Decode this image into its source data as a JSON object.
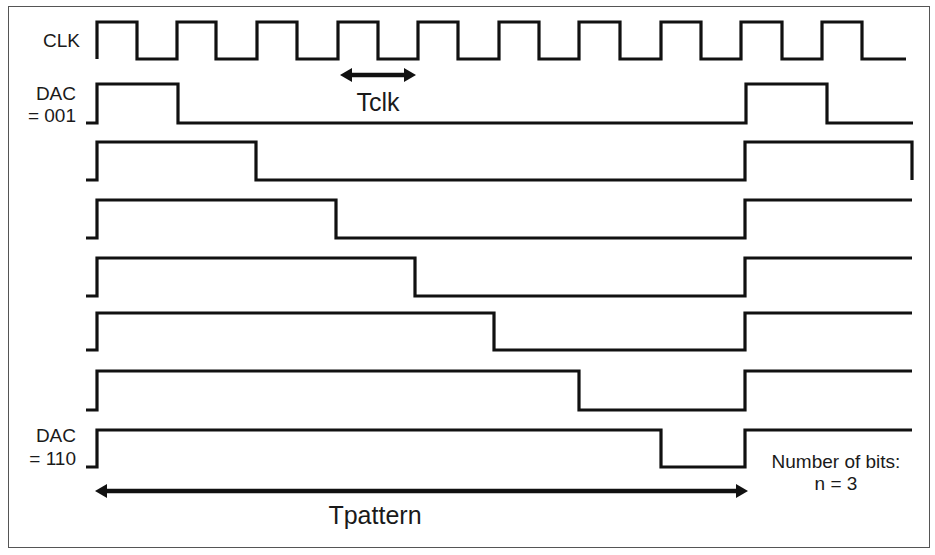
{
  "figure": {
    "labels": {
      "clk": "CLK",
      "dac_first_line1": "DAC",
      "dac_first_line2": "= 001",
      "dac_last_line1": "DAC",
      "dac_last_line2": "= 110",
      "tclk": "Tclk",
      "tpattern": "Tpattern",
      "bits_line1": "Number of bits:",
      "bits_line2": "n = 3"
    },
    "colors": {
      "line": "#111111",
      "frame": "#555555",
      "background": "#ffffff"
    },
    "clock": {
      "name": "CLK",
      "y_high": 22,
      "y_low": 59,
      "x_start": 97,
      "x_end": 906,
      "edges": [
        97,
        137,
        177,
        216,
        257,
        297,
        338,
        378,
        418,
        458,
        499,
        539,
        579,
        620,
        661,
        701,
        741,
        782,
        822,
        862
      ]
    },
    "dac_rows": [
      {
        "code": "001",
        "y_high": 84,
        "y_low": 123,
        "lead_x": 86,
        "rise_x": 97,
        "fall_x": 178,
        "rise2_x": 746,
        "fall2_x": 827,
        "end_x": 913
      },
      {
        "code": "010",
        "y_high": 142,
        "y_low": 180,
        "lead_x": 86,
        "rise_x": 97,
        "fall_x": 256,
        "rise2_x": 745,
        "fall2_x": 912,
        "end_x": 912
      },
      {
        "code": "011",
        "y_high": 200,
        "y_low": 238,
        "lead_x": 86,
        "rise_x": 97,
        "fall_x": 336,
        "rise2_x": 745,
        "fall2_x": null,
        "end_x": 912
      },
      {
        "code": "100",
        "y_high": 258,
        "y_low": 296,
        "lead_x": 86,
        "rise_x": 97,
        "fall_x": 415,
        "rise2_x": 745,
        "fall2_x": null,
        "end_x": 912
      },
      {
        "code": "101",
        "y_high": 313,
        "y_low": 350,
        "lead_x": 86,
        "rise_x": 97,
        "fall_x": 494,
        "rise2_x": 745,
        "fall2_x": null,
        "end_x": 912
      },
      {
        "code": "110a",
        "y_high": 371,
        "y_low": 410,
        "lead_x": 86,
        "rise_x": 97,
        "fall_x": 579,
        "rise2_x": 745,
        "fall2_x": null,
        "end_x": 912
      },
      {
        "code": "110",
        "y_high": 430,
        "y_low": 467,
        "lead_x": 86,
        "rise_x": 97,
        "fall_x": 661,
        "rise2_x": 745,
        "fall2_x": null,
        "end_x": 912
      }
    ],
    "arrows": {
      "tclk": {
        "x1": 340,
        "x2": 416,
        "y": 75,
        "double": true
      },
      "tpattern": {
        "x1": 95,
        "x2": 748,
        "y": 491,
        "double": true
      }
    },
    "n_bits": 3
  }
}
